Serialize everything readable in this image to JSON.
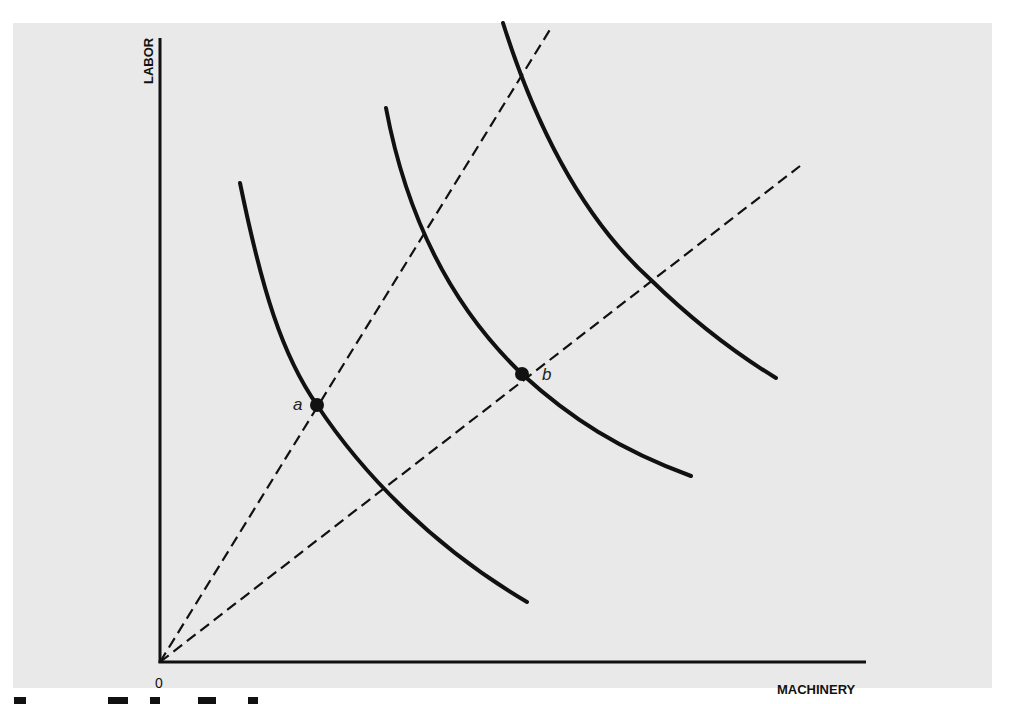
{
  "diagram": {
    "type": "isoquant-map",
    "axes": {
      "x_label": "MACHINERY",
      "y_label": "LABOR",
      "origin_label": "0"
    },
    "points": [
      {
        "label": "a",
        "x": 317,
        "y": 405,
        "on_curve": "isoquant-1",
        "on_ray": "ray-steep"
      },
      {
        "label": "b",
        "x": 522,
        "y": 374,
        "on_curve": "isoquant-2",
        "on_ray": "ray-shallow"
      }
    ],
    "isoquants": [
      {
        "name": "isoquant-1",
        "start": [
          240,
          183
        ],
        "end": [
          527,
          602
        ]
      },
      {
        "name": "isoquant-2",
        "start": [
          386,
          108
        ],
        "end": [
          691,
          476
        ]
      },
      {
        "name": "isoquant-3",
        "start": [
          503,
          23
        ],
        "end": [
          776,
          378
        ]
      }
    ],
    "rays": [
      {
        "name": "ray-steep",
        "from": [
          160,
          662
        ],
        "to": [
          551,
          28
        ],
        "style": "dashed"
      },
      {
        "name": "ray-shallow",
        "from": [
          160,
          662
        ],
        "to": [
          800,
          166
        ],
        "style": "dashed"
      }
    ],
    "colors": {
      "panel_background": "#e9e9e9",
      "page_background": "#ffffff",
      "ink": "#111111"
    }
  },
  "caption": {
    "visible": "cropped"
  }
}
